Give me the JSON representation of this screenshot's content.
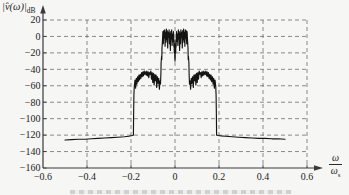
{
  "colors": {
    "paper": "#f6f6f4",
    "axis": "#3a3a3a",
    "grid": "#6e6e6e",
    "curve": "#141414",
    "text": "#222222"
  },
  "chart_data": {
    "type": "line",
    "title": "",
    "ylabel_main": "|v̂(ω)|",
    "ylabel_sub": "dB",
    "xlabel_numerator": "ω",
    "xlabel_denominator": "ω",
    "xlabel_denominator_sub": "s",
    "xlim": [
      -0.6,
      0.6
    ],
    "ylim": [
      -160,
      20
    ],
    "grid": "dashed",
    "legend": "none",
    "x_ticks": [
      -0.6,
      -0.4,
      -0.2,
      0,
      0.2,
      0.4,
      0.6
    ],
    "x_tick_labels": [
      "−0.6",
      "−0.4",
      "−0.2",
      "0",
      "0.2",
      "0.4",
      "0.6"
    ],
    "y_ticks": [
      20,
      0,
      -20,
      -40,
      -60,
      -80,
      -100,
      -120,
      -140,
      -160
    ],
    "y_tick_labels": [
      "20",
      "0",
      "−20",
      "−40",
      "−60",
      "−80",
      "−100",
      "−120",
      "−140",
      "−160"
    ],
    "series": [
      {
        "name": "spectrum",
        "points": [
          [
            -0.5,
            -126
          ],
          [
            -0.47,
            -125.5
          ],
          [
            -0.44,
            -125
          ],
          [
            -0.41,
            -125
          ],
          [
            -0.38,
            -124.5
          ],
          [
            -0.35,
            -124
          ],
          [
            -0.32,
            -123.5
          ],
          [
            -0.29,
            -123
          ],
          [
            -0.26,
            -122.5
          ],
          [
            -0.23,
            -122
          ],
          [
            -0.21,
            -121.5
          ],
          [
            -0.195,
            -120.5
          ],
          [
            -0.189,
            -120
          ],
          [
            -0.188,
            -97
          ],
          [
            -0.187,
            -72
          ],
          [
            -0.185,
            -60
          ],
          [
            -0.182,
            -53
          ],
          [
            -0.179,
            -63
          ],
          [
            -0.176,
            -51
          ],
          [
            -0.173,
            -58
          ],
          [
            -0.17,
            -49
          ],
          [
            -0.167,
            -55
          ],
          [
            -0.164,
            -47
          ],
          [
            -0.161,
            -53
          ],
          [
            -0.158,
            -46
          ],
          [
            -0.155,
            -51
          ],
          [
            -0.152,
            -44
          ],
          [
            -0.149,
            -49
          ],
          [
            -0.146,
            -43
          ],
          [
            -0.143,
            -48
          ],
          [
            -0.14,
            -42
          ],
          [
            -0.137,
            -46
          ],
          [
            -0.134,
            -43
          ],
          [
            -0.131,
            -47
          ],
          [
            -0.128,
            -42
          ],
          [
            -0.125,
            -48
          ],
          [
            -0.122,
            -43
          ],
          [
            -0.119,
            -50
          ],
          [
            -0.116,
            -44
          ],
          [
            -0.113,
            -46
          ],
          [
            -0.11,
            -42
          ],
          [
            -0.107,
            -52
          ],
          [
            -0.104,
            -44
          ],
          [
            -0.101,
            -56
          ],
          [
            -0.098,
            -45
          ],
          [
            -0.095,
            -59
          ],
          [
            -0.092,
            -46
          ],
          [
            -0.089,
            -54
          ],
          [
            -0.086,
            -47
          ],
          [
            -0.083,
            -62
          ],
          [
            -0.08,
            -49
          ],
          [
            -0.077,
            -57
          ],
          [
            -0.074,
            -51
          ],
          [
            -0.071,
            -64
          ],
          [
            -0.068,
            -54
          ],
          [
            -0.066,
            -58
          ],
          [
            -0.064,
            -45
          ],
          [
            -0.063,
            -32
          ],
          [
            -0.061,
            -24
          ],
          [
            -0.06,
            -28
          ],
          [
            -0.059,
            -14
          ],
          [
            -0.057,
            -4
          ],
          [
            -0.055,
            6
          ],
          [
            -0.053,
            -9
          ],
          [
            -0.051,
            7
          ],
          [
            -0.049,
            -2
          ],
          [
            -0.047,
            8
          ],
          [
            -0.045,
            -12
          ],
          [
            -0.043,
            5
          ],
          [
            -0.041,
            -7
          ],
          [
            -0.039,
            9
          ],
          [
            -0.037,
            -4
          ],
          [
            -0.035,
            7
          ],
          [
            -0.033,
            -14
          ],
          [
            -0.031,
            5
          ],
          [
            -0.029,
            -1
          ],
          [
            -0.027,
            8
          ],
          [
            -0.025,
            -9
          ],
          [
            -0.023,
            4
          ],
          [
            -0.021,
            -17
          ],
          [
            -0.019,
            6
          ],
          [
            -0.017,
            -3
          ],
          [
            -0.015,
            8
          ],
          [
            -0.013,
            -11
          ],
          [
            -0.011,
            3
          ],
          [
            -0.009,
            -6
          ],
          [
            -0.007,
            6
          ],
          [
            -0.005,
            -13
          ],
          [
            -0.004,
            -4
          ],
          [
            -0.003,
            -20
          ],
          [
            -0.002,
            -9
          ],
          [
            -0.001,
            -24
          ],
          [
            0.0,
            -30
          ],
          [
            0.001,
            -24
          ],
          [
            0.002,
            -9
          ],
          [
            0.003,
            -20
          ],
          [
            0.004,
            -4
          ],
          [
            0.005,
            -13
          ],
          [
            0.007,
            6
          ],
          [
            0.009,
            -6
          ],
          [
            0.011,
            3
          ],
          [
            0.013,
            -11
          ],
          [
            0.015,
            8
          ],
          [
            0.017,
            -3
          ],
          [
            0.019,
            6
          ],
          [
            0.021,
            -17
          ],
          [
            0.023,
            4
          ],
          [
            0.025,
            -9
          ],
          [
            0.027,
            8
          ],
          [
            0.029,
            -1
          ],
          [
            0.031,
            5
          ],
          [
            0.033,
            -14
          ],
          [
            0.035,
            7
          ],
          [
            0.037,
            -4
          ],
          [
            0.039,
            9
          ],
          [
            0.041,
            -7
          ],
          [
            0.043,
            5
          ],
          [
            0.045,
            -12
          ],
          [
            0.047,
            8
          ],
          [
            0.049,
            -2
          ],
          [
            0.051,
            7
          ],
          [
            0.053,
            -9
          ],
          [
            0.055,
            6
          ],
          [
            0.057,
            -4
          ],
          [
            0.059,
            -14
          ],
          [
            0.06,
            -28
          ],
          [
            0.061,
            -24
          ],
          [
            0.063,
            -32
          ],
          [
            0.064,
            -45
          ],
          [
            0.066,
            -58
          ],
          [
            0.068,
            -54
          ],
          [
            0.071,
            -64
          ],
          [
            0.074,
            -51
          ],
          [
            0.077,
            -57
          ],
          [
            0.08,
            -49
          ],
          [
            0.083,
            -62
          ],
          [
            0.086,
            -47
          ],
          [
            0.089,
            -54
          ],
          [
            0.092,
            -46
          ],
          [
            0.095,
            -59
          ],
          [
            0.098,
            -45
          ],
          [
            0.101,
            -56
          ],
          [
            0.104,
            -44
          ],
          [
            0.107,
            -52
          ],
          [
            0.11,
            -42
          ],
          [
            0.113,
            -46
          ],
          [
            0.116,
            -44
          ],
          [
            0.119,
            -50
          ],
          [
            0.122,
            -43
          ],
          [
            0.125,
            -48
          ],
          [
            0.128,
            -42
          ],
          [
            0.131,
            -47
          ],
          [
            0.134,
            -43
          ],
          [
            0.137,
            -46
          ],
          [
            0.14,
            -42
          ],
          [
            0.143,
            -48
          ],
          [
            0.146,
            -43
          ],
          [
            0.149,
            -49
          ],
          [
            0.152,
            -44
          ],
          [
            0.155,
            -51
          ],
          [
            0.158,
            -46
          ],
          [
            0.161,
            -53
          ],
          [
            0.164,
            -47
          ],
          [
            0.167,
            -55
          ],
          [
            0.17,
            -49
          ],
          [
            0.173,
            -58
          ],
          [
            0.176,
            -51
          ],
          [
            0.179,
            -63
          ],
          [
            0.182,
            -53
          ],
          [
            0.185,
            -60
          ],
          [
            0.187,
            -72
          ],
          [
            0.188,
            -97
          ],
          [
            0.189,
            -120
          ],
          [
            0.195,
            -120.5
          ],
          [
            0.21,
            -121
          ],
          [
            0.23,
            -121.5
          ],
          [
            0.26,
            -122
          ],
          [
            0.29,
            -122.5
          ],
          [
            0.32,
            -123
          ],
          [
            0.35,
            -123.5
          ],
          [
            0.38,
            -124
          ],
          [
            0.41,
            -124
          ],
          [
            0.44,
            -124.5
          ],
          [
            0.47,
            -124.5
          ],
          [
            0.5,
            -125
          ]
        ]
      }
    ]
  }
}
